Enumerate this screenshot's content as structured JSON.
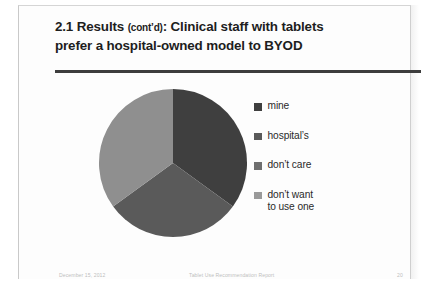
{
  "slide": {
    "title_line1_main": "2.1 Results",
    "title_line1_paren": "(cont’d)",
    "title_line1_rest": ": Clinical staff with tablets",
    "title_line2": "prefer a hospital-owned model to BYOD"
  },
  "footer": {
    "date": "December 15, 2012",
    "center": "Tablet Use Recommendation Report",
    "page": "20"
  },
  "legend": {
    "items": [
      {
        "label": "mine",
        "color": "#3f3f3f"
      },
      {
        "label": "hospital’s",
        "color": "#5a5a5a"
      },
      {
        "label": "don’t care",
        "color": "#6f6f6f"
      },
      {
        "label": "don’t want\nto use one",
        "color": "#9a9a9a"
      }
    ]
  },
  "chart_data": {
    "type": "pie",
    "title": "2.1 Results (cont’d): Clinical staff with tablets prefer a hospital-owned model to BYOD",
    "xlabel": "",
    "ylabel": "",
    "legend_position": "right",
    "grid": false,
    "categories": [
      "mine",
      "hospital’s",
      "don’t care",
      "don’t want to use one"
    ],
    "values": [
      35,
      30,
      35,
      0
    ],
    "colors": [
      "#3f3f3f",
      "#5a5a5a",
      "#8f8f8f",
      "#b5b5b5"
    ],
    "start_angle_deg": 0,
    "direction": "clockwise"
  }
}
